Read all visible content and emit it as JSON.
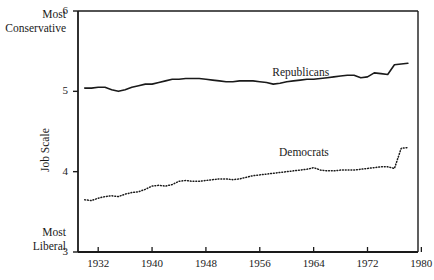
{
  "figure": {
    "background": "#ffffff",
    "ink": "#1a1a1a"
  },
  "axis_notes": {
    "top_line1": "Most",
    "top_line2": "Conservative",
    "bottom_line1": "Most",
    "bottom_line2": "Liberal"
  },
  "chart_data": {
    "type": "line",
    "title": "",
    "xlabel": "",
    "ylabel": "Job Scale",
    "xlim": [
      1929,
      1979.5
    ],
    "ylim": [
      3,
      6
    ],
    "grid": false,
    "legend": "inline-annotations",
    "yticks": [
      3,
      4,
      5,
      6
    ],
    "ytick_labels": [
      "3",
      "4",
      "5",
      "6"
    ],
    "xticks": [
      1932,
      1940,
      1948,
      1956,
      1964,
      1972,
      1980
    ],
    "xtick_labels": [
      "1932",
      "1940",
      "1948",
      "1956",
      "1964",
      "1972",
      "1980"
    ],
    "annotations": [
      {
        "text": "Republicans",
        "x": 1963.5,
        "y": 5.22
      },
      {
        "text": "Democrats",
        "x": 1964.5,
        "y": 4.22
      }
    ],
    "series": [
      {
        "name": "Republicans",
        "style": "solid",
        "color": "#1a1a1a",
        "x": [
          1930,
          1931,
          1932,
          1933,
          1934,
          1935,
          1936,
          1937,
          1938,
          1939,
          1940,
          1941,
          1942,
          1943,
          1944,
          1945,
          1946,
          1947,
          1948,
          1949,
          1950,
          1951,
          1952,
          1953,
          1954,
          1955,
          1956,
          1957,
          1958,
          1959,
          1960,
          1961,
          1962,
          1963,
          1964,
          1965,
          1966,
          1967,
          1968,
          1969,
          1970,
          1971,
          1972,
          1973,
          1974,
          1975,
          1976,
          1977,
          1978
        ],
        "values": [
          5.04,
          5.04,
          5.05,
          5.05,
          5.02,
          5.0,
          5.02,
          5.05,
          5.07,
          5.09,
          5.09,
          5.11,
          5.13,
          5.15,
          5.15,
          5.16,
          5.16,
          5.16,
          5.15,
          5.14,
          5.13,
          5.12,
          5.12,
          5.13,
          5.13,
          5.13,
          5.12,
          5.11,
          5.09,
          5.1,
          5.12,
          5.13,
          5.14,
          5.15,
          5.15,
          5.16,
          5.17,
          5.18,
          5.19,
          5.2,
          5.2,
          5.17,
          5.18,
          5.23,
          5.22,
          5.21,
          5.33,
          5.34,
          5.35
        ]
      },
      {
        "name": "Democrats",
        "style": "dotted",
        "color": "#1a1a1a",
        "x": [
          1930,
          1931,
          1932,
          1933,
          1934,
          1935,
          1936,
          1937,
          1938,
          1939,
          1940,
          1941,
          1942,
          1943,
          1944,
          1945,
          1946,
          1947,
          1948,
          1949,
          1950,
          1951,
          1952,
          1953,
          1954,
          1955,
          1956,
          1957,
          1958,
          1959,
          1960,
          1961,
          1962,
          1963,
          1964,
          1965,
          1966,
          1967,
          1968,
          1969,
          1970,
          1971,
          1972,
          1973,
          1974,
          1975,
          1976,
          1977,
          1978
        ],
        "values": [
          3.65,
          3.64,
          3.67,
          3.69,
          3.7,
          3.69,
          3.72,
          3.74,
          3.75,
          3.78,
          3.82,
          3.83,
          3.82,
          3.84,
          3.88,
          3.89,
          3.88,
          3.88,
          3.89,
          3.9,
          3.91,
          3.91,
          3.9,
          3.91,
          3.93,
          3.95,
          3.96,
          3.97,
          3.98,
          3.99,
          4.0,
          4.01,
          4.02,
          4.03,
          4.05,
          4.02,
          4.01,
          4.01,
          4.02,
          4.02,
          4.02,
          4.03,
          4.04,
          4.05,
          4.06,
          4.06,
          4.04,
          4.29,
          4.3
        ]
      }
    ]
  }
}
